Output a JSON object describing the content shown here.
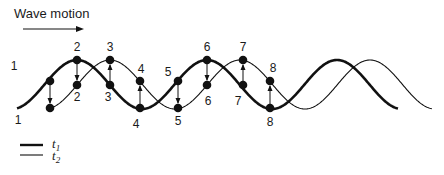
{
  "title": "Wave motion",
  "legend": [
    {
      "label": "t",
      "sub": "1",
      "style": "thick"
    },
    {
      "label": "t",
      "sub": "2",
      "style": "thin"
    }
  ],
  "points": [
    {
      "n": "1",
      "x": 50,
      "y1": 81,
      "y2": 108,
      "lab1": [
        14,
        70
      ],
      "lab2": [
        18,
        124
      ]
    },
    {
      "n": "2",
      "x": 77,
      "y1": 60,
      "y2": 85,
      "lab1": [
        77,
        51
      ],
      "lab2": [
        77,
        101
      ]
    },
    {
      "n": "3",
      "x": 110,
      "y1": 60,
      "y2": 85,
      "lab1": [
        110,
        51
      ],
      "lab2": [
        108,
        101
      ]
    },
    {
      "n": "4",
      "x": 140,
      "y1": 81,
      "y2": 108,
      "lab1": [
        141,
        73
      ],
      "lab2": [
        136,
        128
      ]
    },
    {
      "n": "5",
      "x": 178,
      "y1": 81,
      "y2": 108,
      "lab1": [
        168,
        76
      ],
      "lab2": [
        178,
        125
      ]
    },
    {
      "n": "6",
      "x": 207,
      "y1": 60,
      "y2": 85,
      "lab1": [
        207,
        51
      ],
      "lab2": [
        208,
        105
      ]
    },
    {
      "n": "7",
      "x": 243,
      "y1": 60,
      "y2": 85,
      "lab1": [
        243,
        51
      ],
      "lab2": [
        238,
        105
      ]
    },
    {
      "n": "8",
      "x": 270,
      "y1": 81,
      "y2": 108,
      "lab1": [
        273,
        72
      ],
      "lab2": [
        270,
        126
      ]
    }
  ],
  "colors": {
    "ink": "#111111"
  }
}
